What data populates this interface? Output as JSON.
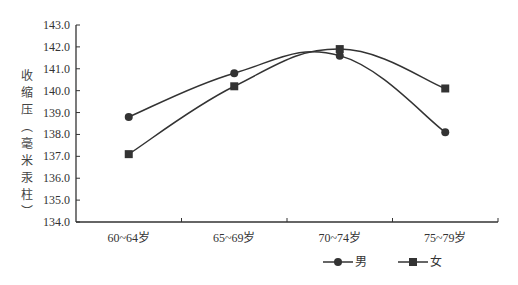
{
  "chart_data": {
    "type": "line",
    "title": "",
    "xlabel": "",
    "ylabel": "收缩压（毫米汞柱）",
    "categories": [
      "60~64岁",
      "65~69岁",
      "70~74岁",
      "75~79岁"
    ],
    "series": [
      {
        "name": "男",
        "marker": "circle",
        "values": [
          138.8,
          140.8,
          141.6,
          138.1
        ]
      },
      {
        "name": "女",
        "marker": "square",
        "values": [
          137.1,
          140.2,
          141.9,
          140.1
        ]
      }
    ],
    "ylim": [
      134.0,
      143.0
    ],
    "yticks": [
      "134.0",
      "135.0",
      "136.0",
      "137.0",
      "138.0",
      "139.0",
      "140.0",
      "141.0",
      "142.0",
      "143.0"
    ],
    "grid": false,
    "legend_position": "bottom",
    "smooth": true,
    "line_color": "#333333"
  },
  "ylabel_chars": [
    "收",
    "缩",
    "压",
    "︵",
    "毫",
    "米",
    "汞",
    "柱",
    "︶"
  ]
}
